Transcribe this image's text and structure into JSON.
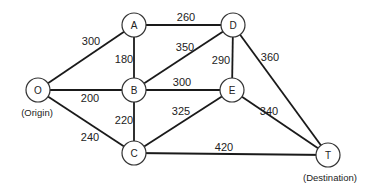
{
  "diagram": {
    "type": "weighted-network",
    "nodes": [
      {
        "id": "O",
        "label": "O",
        "caption": "(Origin)",
        "x": 38,
        "y": 90
      },
      {
        "id": "A",
        "label": "A",
        "x": 134,
        "y": 25
      },
      {
        "id": "B",
        "label": "B",
        "x": 134,
        "y": 90
      },
      {
        "id": "C",
        "label": "C",
        "x": 134,
        "y": 153
      },
      {
        "id": "D",
        "label": "D",
        "x": 233,
        "y": 25
      },
      {
        "id": "E",
        "label": "E",
        "x": 232,
        "y": 90
      },
      {
        "id": "T",
        "label": "T",
        "caption": "(Destination)",
        "x": 328,
        "y": 155
      }
    ],
    "edges": [
      {
        "from": "O",
        "to": "A",
        "weight": "300",
        "lx": 91,
        "ly": 41
      },
      {
        "from": "O",
        "to": "B",
        "weight": "200",
        "lx": 90,
        "ly": 98
      },
      {
        "from": "O",
        "to": "C",
        "weight": "240",
        "lx": 90,
        "ly": 137
      },
      {
        "from": "A",
        "to": "D",
        "weight": "260",
        "lx": 186,
        "ly": 17
      },
      {
        "from": "A",
        "to": "B",
        "weight": "180",
        "lx": 124,
        "ly": 59
      },
      {
        "from": "B",
        "to": "D",
        "weight": "350",
        "lx": 185,
        "ly": 47
      },
      {
        "from": "B",
        "to": "E",
        "weight": "300",
        "lx": 182,
        "ly": 82
      },
      {
        "from": "B",
        "to": "C",
        "weight": "220",
        "lx": 124,
        "ly": 120
      },
      {
        "from": "D",
        "to": "E",
        "weight": "290",
        "lx": 221,
        "ly": 60
      },
      {
        "from": "D",
        "to": "T",
        "weight": "360",
        "lx": 270,
        "ly": 57
      },
      {
        "from": "E",
        "to": "T",
        "weight": "340",
        "lx": 269,
        "ly": 111
      },
      {
        "from": "C",
        "to": "E",
        "weight": "325",
        "lx": 181,
        "ly": 111
      },
      {
        "from": "C",
        "to": "T",
        "weight": "420",
        "lx": 224,
        "ly": 147
      }
    ]
  },
  "labels": {
    "origin_caption": "(Origin)",
    "destination_caption": "(Destination)"
  }
}
